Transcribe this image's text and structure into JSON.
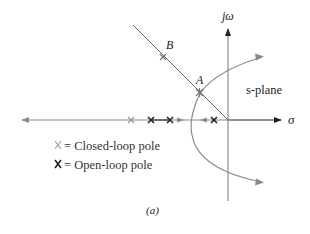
{
  "diagram": {
    "type": "root-locus",
    "plane_label": "s-plane",
    "axes": {
      "real_label": "σ",
      "imag_label": "jω"
    },
    "points": [
      {
        "label": "A",
        "description": "Closed-loop pole on locus at intersection with damping line"
      },
      {
        "label": "B",
        "description": "Closed-loop pole on damping ratio line"
      }
    ],
    "legend": [
      {
        "symbol": "closed-loop-pole",
        "marker": "X",
        "text": "= Closed-loop pole"
      },
      {
        "symbol": "open-loop-pole",
        "marker": "X",
        "text": "= Open-loop pole"
      }
    ],
    "caption": "(a)",
    "colors": {
      "locus": "#8a8a8a",
      "axis": "#222222",
      "open_loop_pole": "#222222",
      "closed_loop_pole": "#9a9a9a"
    }
  }
}
